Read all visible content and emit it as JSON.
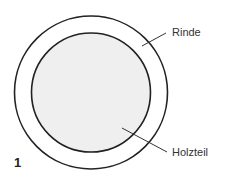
{
  "figure": {
    "number": "1",
    "labels": {
      "outer": "Rinde",
      "inner": "Holzteil"
    },
    "colors": {
      "stroke": "#222222",
      "inner_fill": "#efefef",
      "background": "#ffffff"
    }
  }
}
